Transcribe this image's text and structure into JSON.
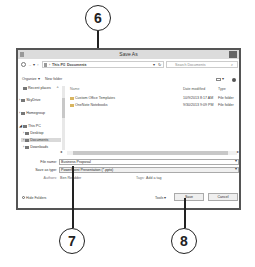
{
  "callouts": [
    {
      "number": "6"
    },
    {
      "number": "7"
    },
    {
      "number": "8"
    }
  ],
  "dialog": {
    "title": "Save As",
    "address_bar": {
      "breadcrumb": [
        "This PC",
        "Documents"
      ],
      "separator": "›",
      "search_placeholder": "Search Documents"
    },
    "toolbar": {
      "organize_label": "Organize ▾",
      "new_folder_label": "New folder"
    },
    "nav_pane": {
      "items": [
        {
          "label": "Recent places"
        },
        {
          "label": "SkyDrive"
        },
        {
          "label": "Homegroup"
        },
        {
          "label": "This PC"
        },
        {
          "label": "Desktop"
        },
        {
          "label": "Documents"
        },
        {
          "label": "Downloads"
        }
      ]
    },
    "file_list": {
      "columns": [
        "Name",
        "Date modified",
        "Type"
      ],
      "rows": [
        {
          "name": "Custom Office Templates",
          "date": "10/9/2013 8:17 AM",
          "type": "File folder"
        },
        {
          "name": "OneNote Notebooks",
          "date": "9/30/2013 9:09 PM",
          "type": "File folder"
        }
      ]
    },
    "form": {
      "file_name_label": "File name:",
      "file_name_value": "Business Proposal",
      "save_type_label": "Save as type:",
      "save_type_value": "PowerPoint Presentation (*.pptx)",
      "authors_label": "Authors:",
      "authors_value": "Ben Readder",
      "tags_label": "Tags:",
      "tags_value": "Add a tag"
    },
    "footer": {
      "hide_folders_label": "Hide Folders",
      "tools_label": "Tools ▾",
      "save_label": "Save",
      "cancel_label": "Cancel"
    }
  }
}
